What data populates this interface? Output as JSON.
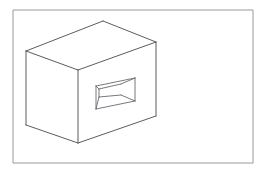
{
  "document": {
    "title": "Technical Line Drawing",
    "subject": "Axonometric box with rectangular recess",
    "background_color": "#ffffff",
    "width": 268,
    "height": 173
  },
  "frame": {
    "name": "border-rectangle",
    "stroke_color": "#9a9a9a",
    "stroke_width": 1,
    "x": 13,
    "y": 10,
    "width": 240,
    "height": 153
  },
  "drawing": {
    "stroke_color": "#5c5c62",
    "fill_color": "#ffffff",
    "stroke_width": 1,
    "vertices": {
      "top_back": [
        103,
        21
      ],
      "top_left": [
        26,
        51
      ],
      "top_front": [
        78,
        70
      ],
      "top_right": [
        156,
        42
      ],
      "bottom_left": [
        26,
        125
      ],
      "bottom_front": [
        78,
        143
      ],
      "bottom_right": [
        156,
        116
      ]
    },
    "faces": [
      {
        "name": "top-face",
        "points": "103,21 26,51 78,70 156,42"
      },
      {
        "name": "left-face",
        "points": "26,51 78,70 78,143 26,125"
      },
      {
        "name": "right-face",
        "points": "78,70 156,42 156,116 78,143"
      }
    ],
    "edges": [
      {
        "name": "edge-top-back-to-top-left",
        "points": "103,21 26,51"
      },
      {
        "name": "edge-top-left-to-top-front",
        "points": "26,51 78,70"
      },
      {
        "name": "edge-top-front-to-top-right",
        "points": "78,70 156,42"
      },
      {
        "name": "edge-top-right-to-top-back",
        "points": "156,42 103,21"
      },
      {
        "name": "edge-left-vertical",
        "points": "26,51 26,125"
      },
      {
        "name": "edge-front-vertical",
        "points": "78,70 78,143"
      },
      {
        "name": "edge-right-vertical",
        "points": "156,42 156,116"
      },
      {
        "name": "edge-bottom-left",
        "points": "26,125 78,143"
      },
      {
        "name": "edge-bottom-right",
        "points": "78,143 156,116"
      }
    ]
  },
  "recess": {
    "name": "rectangular-opening",
    "stroke_color": "#6a6a70",
    "outer_points": "96,86 135,78 135,101 96,109",
    "outer_edges": [
      {
        "name": "recess-edge-top",
        "points": "96,86 135,78"
      },
      {
        "name": "recess-edge-right",
        "points": "135,78 135,101"
      },
      {
        "name": "recess-edge-bottom",
        "points": "135,101 96,109"
      },
      {
        "name": "recess-edge-left",
        "points": "96,109 96,86"
      }
    ],
    "inner": {
      "name": "recess-back-face",
      "points": "99,89 99,97 121,95 121,84",
      "edges": [
        {
          "name": "inner-edge-left",
          "points": "99,89 99,97"
        },
        {
          "name": "inner-edge-top",
          "points": "99,89 121,84"
        },
        {
          "name": "inner-edge-bottom",
          "points": "99,97 121,95"
        }
      ]
    },
    "depth_lines": [
      {
        "name": "depth-line-top-left",
        "points": "96,86 99,89"
      },
      {
        "name": "depth-line-bottom-left",
        "points": "96,109 99,97"
      },
      {
        "name": "depth-line-top-right",
        "points": "135,78 121,84"
      },
      {
        "name": "depth-line-bottom-right",
        "points": "135,101 121,95"
      }
    ]
  }
}
